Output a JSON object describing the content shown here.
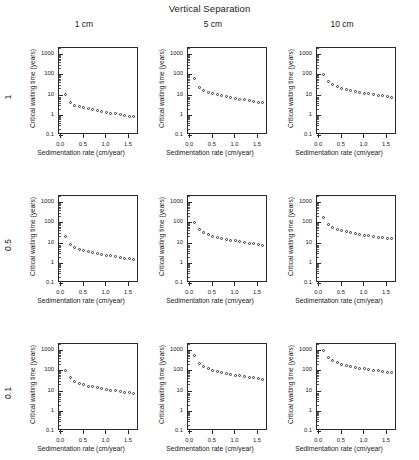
{
  "figure": {
    "super_title": "Vertical Separation",
    "column_headers": [
      "1 cm",
      "5 cm",
      "10 cm"
    ],
    "row_headers": [
      "1",
      "0.5",
      "0.1"
    ],
    "axis": {
      "xlabel": "Sedimentation rate (cm/year)",
      "ylabel": "Critical waiting time (years)",
      "xticks": [
        "0.0",
        "0.5",
        "1.0",
        "1.5"
      ],
      "xtick_values": [
        0.0,
        0.5,
        1.0,
        1.5
      ],
      "yticks": [
        "1000",
        "100",
        "10",
        "1",
        "0.1"
      ],
      "ytick_values": [
        1000,
        100,
        10,
        1,
        0.1
      ],
      "xlim": [
        -0.05,
        1.72
      ],
      "ylim": [
        0.1,
        2000
      ],
      "yscale": "log",
      "xscale": "linear",
      "grid": false,
      "marker": "open-circle",
      "marker_color": "#333333"
    }
  },
  "chart_data": [
    {
      "type": "scatter",
      "title": "1 cm",
      "row_label": "1",
      "col_label": "1 cm",
      "panel": "r0c0",
      "xlabel": "Sedimentation rate (cm/year)",
      "ylabel": "Critical waiting time (years)",
      "yscale": "log",
      "xlim": [
        -0.05,
        1.72
      ],
      "ylim": [
        0.1,
        2000
      ],
      "grid": false,
      "x": [
        0.1,
        0.2,
        0.3,
        0.4,
        0.5,
        0.6,
        0.7,
        0.8,
        0.9,
        1.0,
        1.1,
        1.2,
        1.3,
        1.4,
        1.5,
        1.6
      ],
      "y": [
        9.5,
        4.0,
        3.0,
        2.6,
        2.3,
        2.0,
        1.8,
        1.6,
        1.5,
        1.35,
        1.2,
        1.1,
        1.0,
        0.92,
        0.85,
        0.78
      ]
    },
    {
      "type": "scatter",
      "title": "5 cm",
      "row_label": "1",
      "col_label": "5 cm",
      "panel": "r0c1",
      "xlabel": "Sedimentation rate (cm/year)",
      "ylabel": "Critical waiting time (years)",
      "yscale": "log",
      "xlim": [
        -0.05,
        1.72
      ],
      "ylim": [
        0.1,
        2000
      ],
      "grid": false,
      "x": [
        0.1,
        0.2,
        0.3,
        0.4,
        0.5,
        0.6,
        0.7,
        0.8,
        0.9,
        1.0,
        1.1,
        1.2,
        1.3,
        1.4,
        1.5,
        1.6
      ],
      "y": [
        60.0,
        22.0,
        16.0,
        13.0,
        11.0,
        9.5,
        8.5,
        7.6,
        7.0,
        6.4,
        5.9,
        5.4,
        5.0,
        4.6,
        4.2,
        3.9
      ]
    },
    {
      "type": "scatter",
      "title": "10 cm",
      "row_label": "1",
      "col_label": "10 cm",
      "panel": "r0c2",
      "xlabel": "Sedimentation rate (cm/year)",
      "ylabel": "Critical waiting time (years)",
      "yscale": "log",
      "xlim": [
        -0.05,
        1.72
      ],
      "ylim": [
        0.1,
        2000
      ],
      "grid": false,
      "x": [
        0.1,
        0.2,
        0.3,
        0.4,
        0.5,
        0.6,
        0.7,
        0.8,
        0.9,
        1.0,
        1.1,
        1.2,
        1.3,
        1.4,
        1.5,
        1.6
      ],
      "y": [
        100.0,
        44.0,
        30.0,
        24.0,
        20.0,
        17.5,
        15.5,
        14.0,
        12.8,
        11.8,
        10.8,
        10.0,
        9.2,
        8.5,
        7.8,
        7.2
      ]
    },
    {
      "type": "scatter",
      "title": "1 cm",
      "row_label": "0.5",
      "col_label": "1 cm",
      "panel": "r1c0",
      "xlabel": "Sedimentation rate (cm/year)",
      "ylabel": "Critical waiting time (years)",
      "yscale": "log",
      "xlim": [
        -0.05,
        1.72
      ],
      "ylim": [
        0.1,
        2000
      ],
      "grid": false,
      "x": [
        0.1,
        0.2,
        0.3,
        0.4,
        0.5,
        0.6,
        0.7,
        0.8,
        0.9,
        1.0,
        1.1,
        1.2,
        1.3,
        1.4,
        1.5,
        1.6
      ],
      "y": [
        19.0,
        8.0,
        5.6,
        4.6,
        4.0,
        3.5,
        3.1,
        2.8,
        2.6,
        2.4,
        2.2,
        2.0,
        1.85,
        1.7,
        1.6,
        1.5
      ]
    },
    {
      "type": "scatter",
      "title": "5 cm",
      "row_label": "0.5",
      "col_label": "5 cm",
      "panel": "r1c1",
      "xlabel": "Sedimentation rate (cm/year)",
      "ylabel": "Critical waiting time (years)",
      "yscale": "log",
      "xlim": [
        -0.05,
        1.72
      ],
      "ylim": [
        0.1,
        2000
      ],
      "grid": false,
      "x": [
        0.1,
        0.2,
        0.3,
        0.4,
        0.5,
        0.6,
        0.7,
        0.8,
        0.9,
        1.0,
        1.1,
        1.2,
        1.3,
        1.4,
        1.5,
        1.6
      ],
      "y": [
        100.0,
        42.0,
        30.0,
        24.0,
        21.0,
        18.0,
        16.0,
        14.5,
        13.2,
        12.0,
        11.0,
        10.2,
        9.4,
        8.7,
        8.0,
        7.4
      ]
    },
    {
      "type": "scatter",
      "title": "10 cm",
      "row_label": "0.5",
      "col_label": "10 cm",
      "panel": "r1c2",
      "xlabel": "Sedimentation rate (cm/year)",
      "ylabel": "Critical waiting time (years)",
      "yscale": "log",
      "xlim": [
        -0.05,
        1.72
      ],
      "ylim": [
        0.1,
        2000
      ],
      "grid": false,
      "x": [
        0.1,
        0.2,
        0.3,
        0.4,
        0.5,
        0.6,
        0.7,
        0.8,
        0.9,
        1.0,
        1.1,
        1.2,
        1.3,
        1.4,
        1.5,
        1.6
      ],
      "y": [
        180.0,
        80.0,
        56.0,
        46.0,
        39.0,
        34.0,
        30.0,
        27.5,
        25.0,
        23.0,
        21.5,
        20.0,
        18.5,
        17.0,
        16.0,
        15.0
      ]
    },
    {
      "type": "scatter",
      "title": "1 cm",
      "row_label": "0.1",
      "col_label": "1 cm",
      "panel": "r2c0",
      "xlabel": "Sedimentation rate (cm/year)",
      "ylabel": "Critical waiting time (years)",
      "yscale": "log",
      "xlim": [
        -0.05,
        1.72
      ],
      "ylim": [
        0.1,
        2000
      ],
      "grid": false,
      "x": [
        0.1,
        0.2,
        0.3,
        0.4,
        0.5,
        0.6,
        0.7,
        0.8,
        0.9,
        1.0,
        1.1,
        1.2,
        1.3,
        1.4,
        1.5,
        1.6
      ],
      "y": [
        100.0,
        42.0,
        28.0,
        22.0,
        19.0,
        16.5,
        15.0,
        13.5,
        12.2,
        11.2,
        10.4,
        9.6,
        8.9,
        8.2,
        7.6,
        7.0
      ]
    },
    {
      "type": "scatter",
      "title": "5 cm",
      "row_label": "0.1",
      "col_label": "5 cm",
      "panel": "r2c1",
      "xlabel": "Sedimentation rate (cm/year)",
      "ylabel": "Critical waiting time (years)",
      "yscale": "log",
      "xlim": [
        -0.05,
        1.72
      ],
      "ylim": [
        0.1,
        2000
      ],
      "grid": false,
      "x": [
        0.1,
        0.2,
        0.3,
        0.4,
        0.5,
        0.6,
        0.7,
        0.8,
        0.9,
        1.0,
        1.1,
        1.2,
        1.3,
        1.4,
        1.5,
        1.6
      ],
      "y": [
        520.0,
        220.0,
        150.0,
        120.0,
        100.0,
        87.0,
        78.0,
        70.0,
        64.0,
        58.0,
        53.0,
        49.0,
        45.0,
        42.0,
        39.0,
        36.0
      ]
    },
    {
      "type": "scatter",
      "title": "10 cm",
      "row_label": "0.1",
      "col_label": "10 cm",
      "panel": "r2c2",
      "xlabel": "Sedimentation rate (cm/year)",
      "ylabel": "Critical waiting time (years)",
      "yscale": "log",
      "xlim": [
        -0.05,
        1.72
      ],
      "ylim": [
        0.1,
        2000
      ],
      "grid": false,
      "x": [
        0.1,
        0.2,
        0.3,
        0.4,
        0.5,
        0.6,
        0.7,
        0.8,
        0.9,
        1.0,
        1.1,
        1.2,
        1.3,
        1.4,
        1.5,
        1.6
      ],
      "y": [
        1000.0,
        440.0,
        300.0,
        240.0,
        200.0,
        175.0,
        155.0,
        140.0,
        128.0,
        118.0,
        108.0,
        100.0,
        93.0,
        86.0,
        80.0,
        75.0
      ]
    }
  ]
}
